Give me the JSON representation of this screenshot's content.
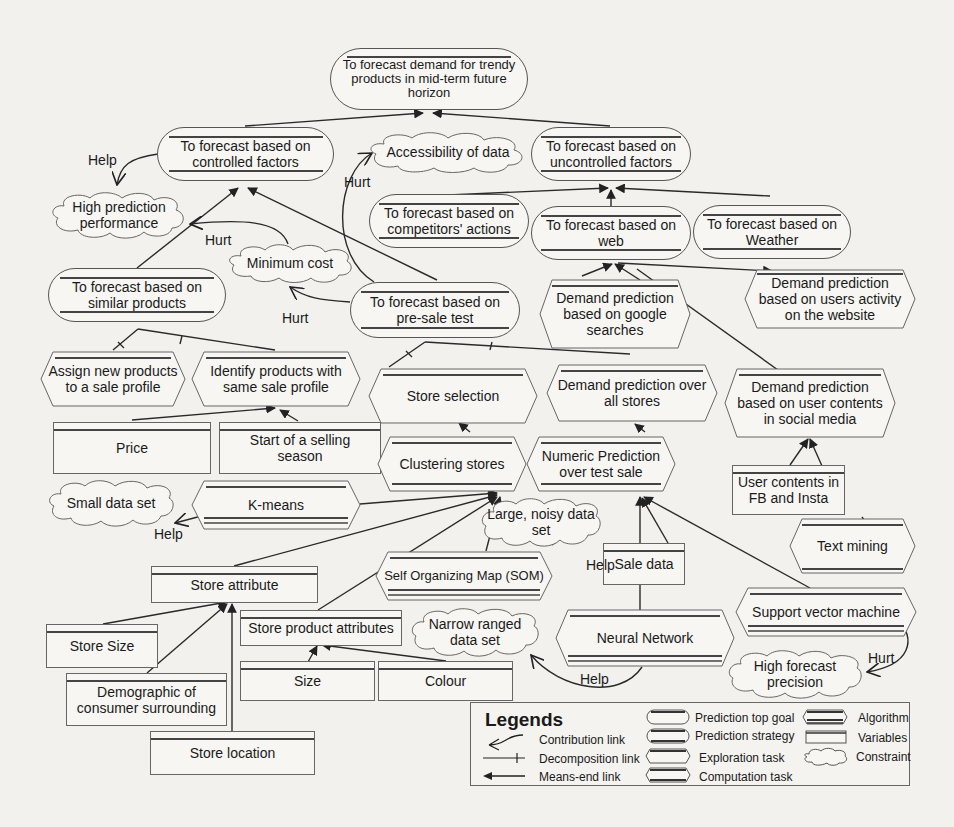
{
  "diagram": {
    "nodes": {
      "top_goal": "To forecast demand for trendy products in mid-term future horizon",
      "controlled": "To forecast based on controlled factors",
      "uncontrolled": "To forecast based on uncontrolled factors",
      "competitors": "To forecast based on competitors' actions",
      "web": "To forecast based on web",
      "weather": "To forecast based on Weather",
      "similar": "To forecast based on similar products",
      "presale": "To forecast based on pre-sale test",
      "google": "Demand prediction based on google searches",
      "users_activity": "Demand prediction based on users activity on the website",
      "assign": "Assign new products to a sale profile",
      "identify": "Identify products with same sale profile",
      "store_selection": "Store selection",
      "all_stores": "Demand prediction over all stores",
      "social": "Demand prediction based on user contents in social media",
      "price": "Price",
      "season": "Start of a selling season",
      "clustering": "Clustering stores",
      "numeric": "Numeric Prediction over test sale",
      "fb_insta": "User contents in FB and Insta",
      "kmeans": "K-means",
      "text_mining": "Text mining",
      "store_attr": "Store attribute",
      "som": "Self Organizing Map (SOM)",
      "sale_data": "Sale data",
      "store_size": "Store Size",
      "store_product_attr": "Store product attributes",
      "neural": "Neural Network",
      "svm": "Support vector machine",
      "demographic": "Demographic of consumer surrounding",
      "size": "Size",
      "colour": "Colour",
      "store_location": "Store location"
    },
    "constraints": {
      "high_prediction": "High prediction performance",
      "accessibility": "Accessibility of data",
      "min_cost": "Minimum cost",
      "small_data": "Small data set",
      "large_noisy": "Large, noisy data set",
      "narrow_ranged": "Narrow ranged data set",
      "high_precision": "High forecast precision"
    },
    "link_labels": {
      "help1": "Help",
      "hurt_access": "Hurt",
      "hurt_high_pred": "Hurt",
      "hurt_min_cost": "Hurt",
      "help_kmeans": "Help",
      "help_som": "Help",
      "help_nn": "Help",
      "hurt_svm": "Hurt"
    }
  },
  "legend": {
    "title": "Legends",
    "links": [
      "Contribution link",
      "Decomposition link",
      "Means-end link"
    ],
    "shapes": [
      "Prediction top goal",
      "Prediction strategy",
      "Exploration task",
      "Computation task"
    ],
    "others": [
      "Algorithm",
      "Variables",
      "Constraint"
    ]
  },
  "colors": {
    "background": "#f2f1ee",
    "stroke": "#333333"
  }
}
